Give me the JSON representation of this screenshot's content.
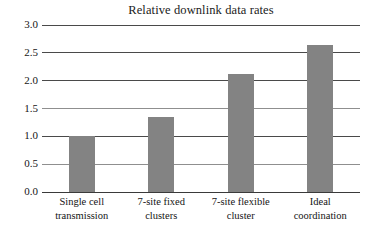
{
  "chart_data": {
    "type": "bar",
    "title": "Relative downlink data rates",
    "xlabel": "",
    "ylabel": "",
    "categories": [
      "Single cell transmission",
      "7-site fixed clusters",
      "7-site flexible cluster",
      "Ideal coordination"
    ],
    "category_lines": [
      [
        "Single cell",
        "transmission"
      ],
      [
        "7-site fixed",
        "clusters"
      ],
      [
        "7-site flexible",
        "cluster"
      ],
      [
        "Ideal",
        "coordination"
      ]
    ],
    "values": [
      1.0,
      1.35,
      2.12,
      2.64
    ],
    "ylim": [
      0.0,
      3.0
    ],
    "yticks": [
      "0.0",
      "0.5",
      "1.0",
      "1.5",
      "2.0",
      "2.5",
      "3.0"
    ],
    "ytick_values": [
      0.0,
      0.5,
      1.0,
      1.5,
      2.0,
      2.5,
      3.0
    ],
    "grid": true,
    "legend": "none",
    "colors": {
      "bar": "#838383",
      "gridline": "#4a4a4a",
      "background": "#ffffff",
      "text": "#151515"
    }
  }
}
